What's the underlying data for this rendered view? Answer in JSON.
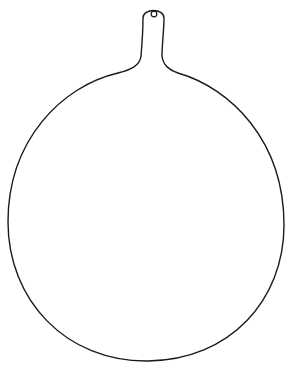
{
  "drawing": {
    "subject": "round paddle board with handle outline",
    "stroke_color": "#1a1a1a",
    "background_color": "#ffffff",
    "parts": [
      {
        "name": "handle",
        "hole": true
      },
      {
        "name": "round-board"
      }
    ]
  }
}
